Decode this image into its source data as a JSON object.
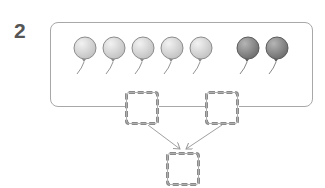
{
  "problem_number": "2",
  "balloons": {
    "light": {
      "count": 5,
      "color": "#d4d4d4",
      "stroke": "#8c8c8c"
    },
    "dark": {
      "count": 2,
      "color": "#8f8f8f",
      "stroke": "#5c5c5c"
    }
  },
  "answer_boxes": [
    {
      "id": "left",
      "value": ""
    },
    {
      "id": "right",
      "value": ""
    },
    {
      "id": "total",
      "value": ""
    }
  ]
}
